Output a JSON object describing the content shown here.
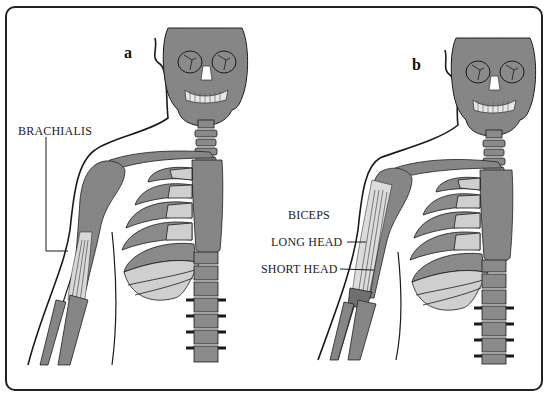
{
  "figure": {
    "panels": [
      {
        "id": "a",
        "letter": "a",
        "labels": [
          {
            "text": "BRACHIALIS"
          }
        ]
      },
      {
        "id": "b",
        "letter": "b",
        "labels": [
          {
            "text": "BICEPS"
          },
          {
            "text": "LONG HEAD"
          },
          {
            "text": "SHORT HEAD"
          }
        ]
      }
    ],
    "colors": {
      "bone_gray": "#8a8a8a",
      "cartilage_light": "#cfcfcf",
      "outline": "#1a1a1a",
      "background": "#ffffff"
    }
  }
}
